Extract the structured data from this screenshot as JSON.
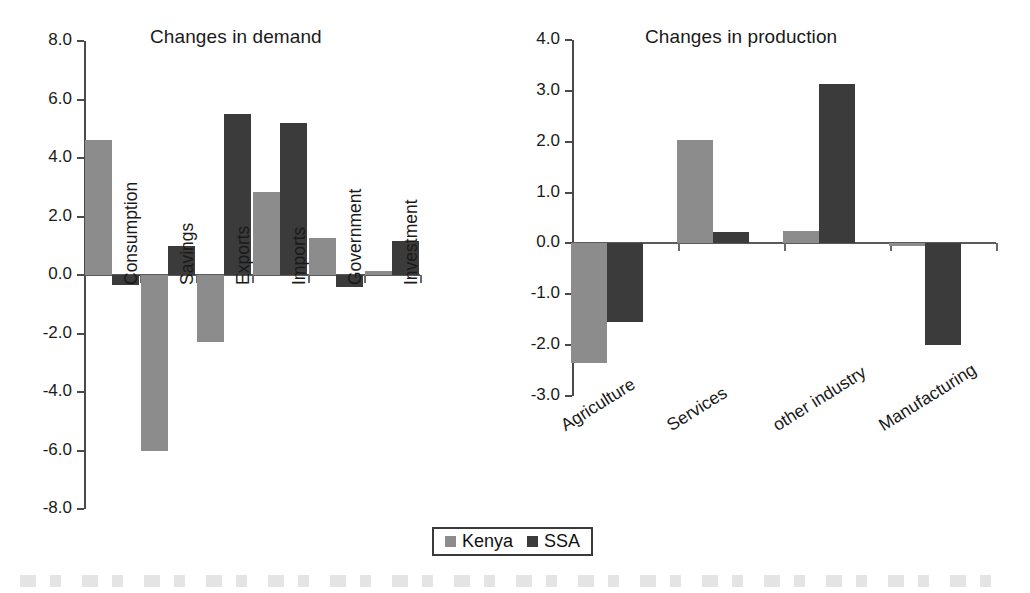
{
  "chart_data": [
    {
      "type": "bar",
      "title": "Changes in demand",
      "xlabel": "",
      "ylabel": "",
      "ylim": [
        -8.0,
        8.0
      ],
      "yticks": [
        "8.0",
        "6.0",
        "4.0",
        "2.0",
        "0.0",
        "-2.0",
        "-4.0",
        "-6.0",
        "-8.0"
      ],
      "ytick_values": [
        8.0,
        6.0,
        4.0,
        2.0,
        0.0,
        -2.0,
        -4.0,
        -6.0,
        -8.0
      ],
      "grid": false,
      "legend_position": "bottom-center",
      "categories": [
        "Consumption",
        "Savings",
        "Exports",
        "Imports",
        "Government",
        "Investment"
      ],
      "series": [
        {
          "name": "Kenya",
          "color": "#8c8c8c",
          "values": [
            4.6,
            -6.0,
            -2.3,
            2.85,
            1.25,
            0.15
          ]
        },
        {
          "name": "SSA",
          "color": "#3b3b3b",
          "values": [
            -0.35,
            1.0,
            5.5,
            5.2,
            -0.4,
            1.15
          ]
        }
      ]
    },
    {
      "type": "bar",
      "title": "Changes in production",
      "xlabel": "",
      "ylabel": "",
      "ylim": [
        -3.0,
        4.0
      ],
      "yticks": [
        "4.0",
        "3.0",
        "2.0",
        "1.0",
        "0.0",
        "-1.0",
        "-2.0",
        "-3.0"
      ],
      "ytick_values": [
        4.0,
        3.0,
        2.0,
        1.0,
        0.0,
        -1.0,
        -2.0,
        -3.0
      ],
      "grid": false,
      "legend_position": "bottom-center",
      "categories": [
        "Agriculture",
        "Services",
        "other industry",
        "Manufacturing"
      ],
      "series": [
        {
          "name": "Kenya",
          "color": "#8c8c8c",
          "values": [
            -2.35,
            2.03,
            0.25,
            -0.05
          ]
        },
        {
          "name": "SSA",
          "color": "#3b3b3b",
          "values": [
            -1.55,
            0.22,
            3.13,
            -2.0
          ]
        }
      ]
    }
  ],
  "legend": {
    "items": [
      {
        "label": "Kenya",
        "color": "#8c8c8c"
      },
      {
        "label": "SSA",
        "color": "#3b3b3b"
      }
    ]
  }
}
